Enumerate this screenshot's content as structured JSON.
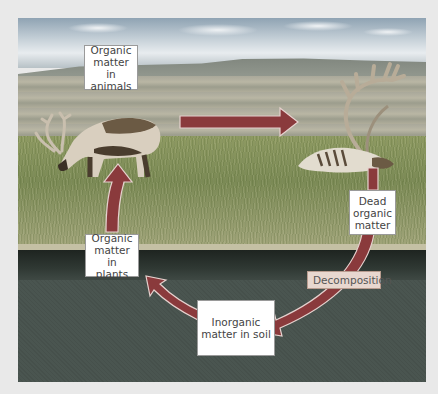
{
  "diagram": {
    "type": "cycle",
    "title": "",
    "colors": {
      "arrow_fill": "#8a3a3c",
      "arrow_outline": "#e6d2cf",
      "label_bg": "#ffffff",
      "process_label_bg": "#e8d7cf",
      "grass": "#7b8a55",
      "soil": "#4a5550",
      "page_bg": "#e9e9e9"
    },
    "nodes": [
      {
        "id": "animals",
        "label": "Organic\nmatter in\nanimals"
      },
      {
        "id": "dead",
        "label": "Dead\norganic\nmatter"
      },
      {
        "id": "soil",
        "label": "Inorganic\nmatter in soil"
      },
      {
        "id": "plants",
        "label": "Organic\nmatter in\nplants"
      }
    ],
    "edges": [
      {
        "from": "animals",
        "to": "dead",
        "label": ""
      },
      {
        "from": "dead",
        "to": "soil",
        "label": "Decomposition"
      },
      {
        "from": "soil",
        "to": "plants",
        "label": ""
      },
      {
        "from": "plants",
        "to": "animals",
        "label": ""
      }
    ],
    "process_label": "Decomposition",
    "scene": {
      "living_animal": "grazing caribou",
      "dead_animal": "caribou carcass",
      "background": "tundra grassland with soil cross-section"
    }
  }
}
